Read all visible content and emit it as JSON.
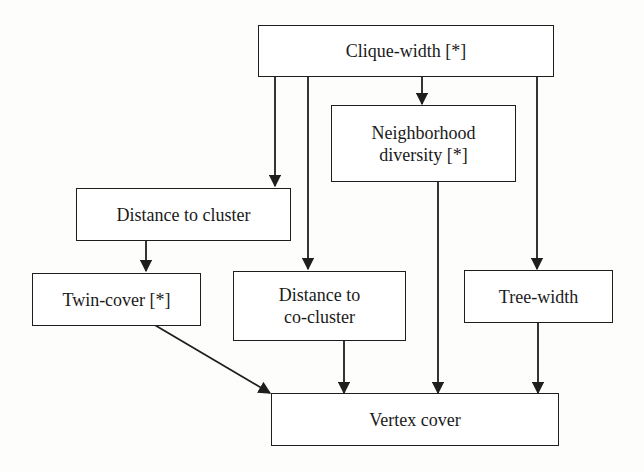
{
  "diagram": {
    "type": "parameter-hierarchy",
    "nodes": {
      "clique_width": "Clique-width [*]",
      "neighborhood_diversity_l1": "Neighborhood",
      "neighborhood_diversity_l2": "diversity [*]",
      "distance_to_cluster": "Distance to cluster",
      "twin_cover": "Twin-cover [*]",
      "distance_to_cocluster_l1": "Distance to",
      "distance_to_cocluster_l2": "co-cluster",
      "tree_width": "Tree-width",
      "vertex_cover": "Vertex cover"
    },
    "edges": [
      {
        "from": "Clique-width [*]",
        "to": "Distance to cluster"
      },
      {
        "from": "Clique-width [*]",
        "to": "Distance to co-cluster"
      },
      {
        "from": "Clique-width [*]",
        "to": "Neighborhood diversity [*]"
      },
      {
        "from": "Clique-width [*]",
        "to": "Tree-width"
      },
      {
        "from": "Distance to cluster",
        "to": "Twin-cover [*]"
      },
      {
        "from": "Twin-cover [*]",
        "to": "Vertex cover"
      },
      {
        "from": "Distance to co-cluster",
        "to": "Vertex cover"
      },
      {
        "from": "Neighborhood diversity [*]",
        "to": "Vertex cover"
      },
      {
        "from": "Tree-width",
        "to": "Vertex cover"
      }
    ]
  }
}
